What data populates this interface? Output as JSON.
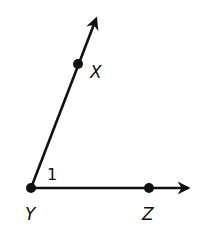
{
  "diagram": {
    "type": "angle",
    "vertex": {
      "name": "Y",
      "x": 31,
      "y": 188
    },
    "rays": [
      {
        "name": "ray-YX",
        "through": "X",
        "point": {
          "x": 78,
          "y": 64
        },
        "tip": {
          "x": 98,
          "y": 14
        }
      },
      {
        "name": "ray-YZ",
        "through": "Z",
        "point": {
          "x": 149,
          "y": 188
        },
        "tip": {
          "x": 193,
          "y": 188
        }
      }
    ],
    "labels": {
      "X": "X",
      "Y": "Y",
      "Z": "Z",
      "angle": "1"
    },
    "color": "#111111"
  }
}
